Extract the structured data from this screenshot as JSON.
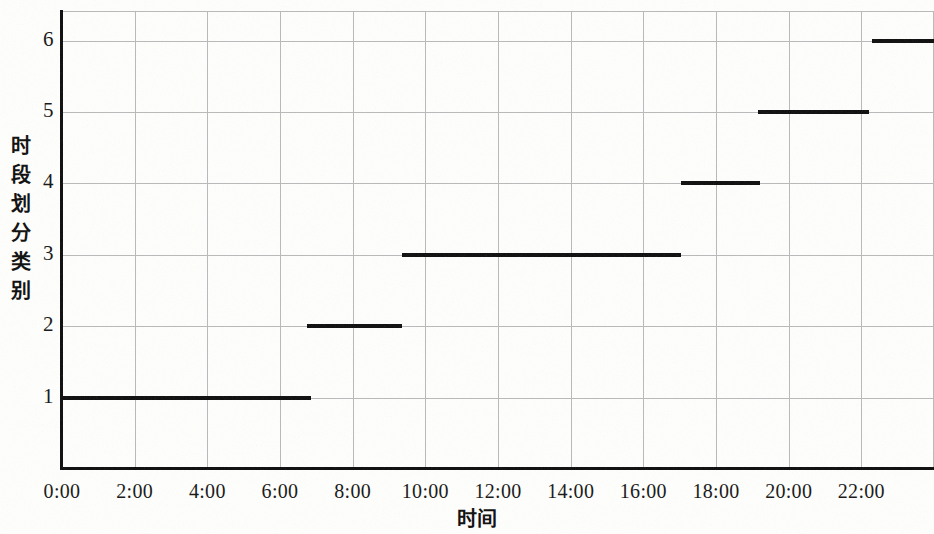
{
  "chart_data": {
    "type": "line",
    "title": "",
    "subtitle": "",
    "xlabel": "时间",
    "ylabel": "时段划分类别",
    "xlim": [
      0,
      24
    ],
    "ylim": [
      0,
      6.4
    ],
    "grid": true,
    "legend": "none",
    "x_tick_labels": [
      "0:00",
      "2:00",
      "4:00",
      "6:00",
      "8:00",
      "10:00",
      "12:00",
      "14:00",
      "16:00",
      "18:00",
      "20:00",
      "22:00"
    ],
    "x_tick_values": [
      0,
      2,
      4,
      6,
      8,
      10,
      12,
      14,
      16,
      18,
      20,
      22
    ],
    "y_tick_labels": [
      "1",
      "2",
      "3",
      "4",
      "5",
      "6"
    ],
    "y_tick_values": [
      1,
      2,
      3,
      4,
      5,
      6
    ],
    "series": [
      {
        "name": "时段划分类别",
        "segments": [
          {
            "category": 1,
            "x_start": 0.0,
            "x_end": 6.85,
            "label": "0:00-6:51"
          },
          {
            "category": 2,
            "x_start": 6.75,
            "x_end": 9.35,
            "label": "6:45-9:21"
          },
          {
            "category": 3,
            "x_start": 9.35,
            "x_end": 17.05,
            "label": "9:21-17:03"
          },
          {
            "category": 4,
            "x_start": 17.05,
            "x_end": 19.2,
            "label": "17:03-19:12"
          },
          {
            "category": 5,
            "x_start": 19.15,
            "x_end": 22.2,
            "label": "19:09-22:12"
          },
          {
            "category": 6,
            "x_start": 22.3,
            "x_end": 24.0,
            "label": "22:18-24:00"
          }
        ]
      }
    ]
  },
  "axis": {
    "y_title_chars": [
      "时",
      "段",
      "划",
      "分",
      "类",
      "别"
    ],
    "x_title": "时间"
  }
}
